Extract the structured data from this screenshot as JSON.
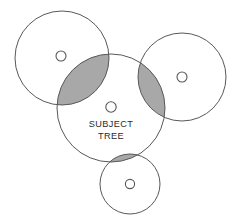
{
  "figure": {
    "type": "plot-overlap-diagram",
    "background_color": "#ffffff",
    "stroke_color": "#58585a",
    "overlap_fill_color": "#a8a8a8",
    "label_color": "#2b2b2b"
  },
  "labels": {
    "subject_line1": "SUBJECT",
    "subject_line2": "TREE"
  },
  "circles": [
    {
      "id": "subject-tree-plot",
      "name": "subject-tree-circle",
      "cx": 111,
      "cy": 108,
      "r": 54,
      "marker_cx": 111,
      "marker_cy": 107,
      "marker_r": 5.2,
      "labelled": true
    },
    {
      "id": "neighbor-upper-left-plot",
      "name": "neighbor-circle-upper-left",
      "cx": 62,
      "cy": 58,
      "r": 47,
      "marker_cx": 61,
      "marker_cy": 56,
      "marker_r": 5.0,
      "labelled": false
    },
    {
      "id": "neighbor-right-plot",
      "name": "neighbor-circle-right",
      "cx": 182,
      "cy": 77,
      "r": 44,
      "marker_cx": 182,
      "marker_cy": 77,
      "marker_r": 5.0,
      "labelled": false
    },
    {
      "id": "neighbor-bottom-plot",
      "name": "neighbor-circle-bottom",
      "cx": 130,
      "cy": 184,
      "r": 30,
      "marker_cx": 130,
      "marker_cy": 184,
      "marker_r": 4.6,
      "labelled": false
    }
  ],
  "overlaps": [
    {
      "id": "overlap-upper-left",
      "name": "overlap-region-upper-left",
      "circle_a": "subject-tree-plot",
      "circle_b": "neighbor-upper-left-plot",
      "fill": "#a8a8a8"
    },
    {
      "id": "overlap-right",
      "name": "overlap-region-right",
      "circle_a": "subject-tree-plot",
      "circle_b": "neighbor-right-plot",
      "fill": "#a8a8a8"
    },
    {
      "id": "overlap-bottom",
      "name": "overlap-region-bottom",
      "circle_a": "subject-tree-plot",
      "circle_b": "neighbor-bottom-plot",
      "fill": "#a8a8a8"
    }
  ]
}
